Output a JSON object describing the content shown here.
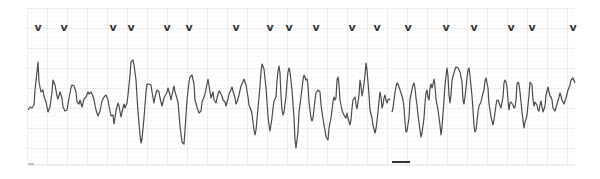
{
  "chart_data": {
    "type": "line",
    "title": "",
    "subtitle": "",
    "xlabel": "",
    "ylabel": "",
    "grid": true,
    "legend": null,
    "paper": {
      "x0": 27,
      "x1": 575,
      "y0": 8,
      "y1": 165,
      "break_x": 390
    },
    "colors": {
      "trace": "#4a4a4a",
      "grid_minor": "#e4e4e4",
      "grid_major": "#cfcfcf",
      "marker": "#333333",
      "background": "#ffffff"
    },
    "markers": {
      "symbol": "v",
      "y": 27,
      "x": [
        38,
        64,
        113,
        131,
        167,
        189,
        236,
        270,
        289,
        316,
        352,
        377,
        408,
        446,
        474,
        511,
        532,
        573
      ]
    },
    "trace_points": [
      [
        28,
        110
      ],
      [
        30,
        107
      ],
      [
        32,
        108
      ],
      [
        34,
        105
      ],
      [
        35,
        90
      ],
      [
        37,
        72
      ],
      [
        38,
        62
      ],
      [
        39,
        82
      ],
      [
        41,
        92
      ],
      [
        43,
        90
      ],
      [
        44,
        96
      ],
      [
        46,
        102
      ],
      [
        48,
        112
      ],
      [
        50,
        107
      ],
      [
        52,
        92
      ],
      [
        53,
        80
      ],
      [
        55,
        85
      ],
      [
        57,
        96
      ],
      [
        58,
        99
      ],
      [
        60,
        92
      ],
      [
        62,
        98
      ],
      [
        63,
        107
      ],
      [
        65,
        111
      ],
      [
        67,
        110
      ],
      [
        69,
        98
      ],
      [
        71,
        88
      ],
      [
        72,
        85
      ],
      [
        74,
        86
      ],
      [
        76,
        92
      ],
      [
        77,
        102
      ],
      [
        79,
        104
      ],
      [
        80,
        100
      ],
      [
        82,
        107
      ],
      [
        84,
        99
      ],
      [
        86,
        97
      ],
      [
        88,
        92
      ],
      [
        89,
        94
      ],
      [
        91,
        92
      ],
      [
        93,
        96
      ],
      [
        94,
        100
      ],
      [
        96,
        110
      ],
      [
        98,
        116
      ],
      [
        100,
        111
      ],
      [
        102,
        101
      ],
      [
        104,
        97
      ],
      [
        106,
        95
      ],
      [
        108,
        100
      ],
      [
        109,
        106
      ],
      [
        111,
        116
      ],
      [
        113,
        115
      ],
      [
        114,
        124
      ],
      [
        116,
        111
      ],
      [
        118,
        103
      ],
      [
        119,
        106
      ],
      [
        121,
        117
      ],
      [
        122,
        112
      ],
      [
        124,
        104
      ],
      [
        125,
        108
      ],
      [
        127,
        103
      ],
      [
        128,
        95
      ],
      [
        130,
        75
      ],
      [
        131,
        62
      ],
      [
        133,
        60
      ],
      [
        134,
        65
      ],
      [
        136,
        80
      ],
      [
        138,
        112
      ],
      [
        140,
        135
      ],
      [
        141,
        143
      ],
      [
        142,
        139
      ],
      [
        144,
        118
      ],
      [
        146,
        92
      ],
      [
        147,
        84
      ],
      [
        149,
        84
      ],
      [
        151,
        85
      ],
      [
        152,
        92
      ],
      [
        154,
        103
      ],
      [
        155,
        97
      ],
      [
        157,
        90
      ],
      [
        159,
        92
      ],
      [
        160,
        98
      ],
      [
        162,
        106
      ],
      [
        164,
        98
      ],
      [
        165,
        96
      ],
      [
        167,
        92
      ],
      [
        168,
        88
      ],
      [
        170,
        95
      ],
      [
        171,
        100
      ],
      [
        173,
        90
      ],
      [
        174,
        86
      ],
      [
        175,
        92
      ],
      [
        176,
        95
      ],
      [
        178,
        102
      ],
      [
        180,
        126
      ],
      [
        182,
        142
      ],
      [
        184,
        144
      ],
      [
        185,
        130
      ],
      [
        187,
        100
      ],
      [
        189,
        82
      ],
      [
        190,
        77
      ],
      [
        192,
        75
      ],
      [
        194,
        84
      ],
      [
        195,
        100
      ],
      [
        197,
        107
      ],
      [
        199,
        113
      ],
      [
        201,
        111
      ],
      [
        202,
        102
      ],
      [
        204,
        97
      ],
      [
        205,
        94
      ],
      [
        207,
        84
      ],
      [
        208,
        79
      ],
      [
        210,
        92
      ],
      [
        211,
        98
      ],
      [
        213,
        92
      ],
      [
        214,
        100
      ],
      [
        216,
        103
      ],
      [
        217,
        98
      ],
      [
        219,
        91
      ],
      [
        220,
        92
      ],
      [
        222,
        96
      ],
      [
        223,
        100
      ],
      [
        225,
        102
      ],
      [
        226,
        106
      ],
      [
        228,
        99
      ],
      [
        229,
        94
      ],
      [
        231,
        90
      ],
      [
        232,
        87
      ],
      [
        233,
        91
      ],
      [
        235,
        98
      ],
      [
        236,
        104
      ],
      [
        237,
        102
      ],
      [
        239,
        95
      ],
      [
        241,
        86
      ],
      [
        243,
        82
      ],
      [
        244,
        79
      ],
      [
        246,
        85
      ],
      [
        248,
        97
      ],
      [
        249,
        105
      ],
      [
        251,
        110
      ],
      [
        252,
        114
      ],
      [
        254,
        130
      ],
      [
        255,
        135
      ],
      [
        256,
        130
      ],
      [
        258,
        108
      ],
      [
        260,
        86
      ],
      [
        261,
        72
      ],
      [
        262,
        64
      ],
      [
        264,
        69
      ],
      [
        266,
        88
      ],
      [
        268,
        116
      ],
      [
        269,
        125
      ],
      [
        270,
        131
      ],
      [
        272,
        118
      ],
      [
        273,
        108
      ],
      [
        274,
        101
      ],
      [
        276,
        97
      ],
      [
        277,
        81
      ],
      [
        278,
        71
      ],
      [
        279,
        66
      ],
      [
        280,
        73
      ],
      [
        281,
        96
      ],
      [
        282,
        110
      ],
      [
        283,
        115
      ],
      [
        284,
        112
      ],
      [
        286,
        96
      ],
      [
        287,
        82
      ],
      [
        288,
        72
      ],
      [
        289,
        68
      ],
      [
        290,
        72
      ],
      [
        292,
        90
      ],
      [
        294,
        118
      ],
      [
        295,
        140
      ],
      [
        296,
        148
      ],
      [
        298,
        132
      ],
      [
        299,
        112
      ],
      [
        301,
        97
      ],
      [
        303,
        80
      ],
      [
        304,
        75
      ],
      [
        306,
        80
      ],
      [
        307,
        79
      ],
      [
        308,
        85
      ],
      [
        309,
        102
      ],
      [
        311,
        118
      ],
      [
        312,
        121
      ],
      [
        313,
        118
      ],
      [
        315,
        100
      ],
      [
        316,
        93
      ],
      [
        318,
        90
      ],
      [
        320,
        92
      ],
      [
        321,
        105
      ],
      [
        322,
        112
      ],
      [
        324,
        125
      ],
      [
        325,
        130
      ],
      [
        326,
        137
      ],
      [
        328,
        140
      ],
      [
        329,
        128
      ],
      [
        331,
        118
      ],
      [
        332,
        110
      ],
      [
        333,
        102
      ],
      [
        334,
        97
      ],
      [
        335,
        100
      ],
      [
        336,
        98
      ],
      [
        337,
        80
      ],
      [
        338,
        77
      ],
      [
        339,
        85
      ],
      [
        340,
        100
      ],
      [
        341,
        105
      ],
      [
        342,
        110
      ],
      [
        343,
        113
      ],
      [
        345,
        117
      ],
      [
        346,
        118
      ],
      [
        347,
        113
      ],
      [
        348,
        118
      ],
      [
        350,
        125
      ],
      [
        351,
        120
      ],
      [
        352,
        108
      ],
      [
        353,
        100
      ],
      [
        355,
        97
      ],
      [
        356,
        104
      ],
      [
        357,
        109
      ],
      [
        359,
        95
      ],
      [
        360,
        80
      ],
      [
        361,
        86
      ],
      [
        362,
        96
      ],
      [
        363,
        91
      ],
      [
        364,
        84
      ],
      [
        365,
        75
      ],
      [
        366,
        63
      ],
      [
        367,
        70
      ],
      [
        369,
        95
      ],
      [
        370,
        110
      ],
      [
        372,
        118
      ],
      [
        373,
        125
      ],
      [
        375,
        133
      ],
      [
        376,
        129
      ],
      [
        378,
        112
      ],
      [
        379,
        101
      ],
      [
        380,
        92
      ],
      [
        381,
        97
      ],
      [
        382,
        108
      ],
      [
        383,
        105
      ],
      [
        384,
        98
      ],
      [
        385,
        95
      ],
      [
        386,
        100
      ],
      [
        387,
        103
      ],
      [
        388,
        100
      ],
      [
        389,
        99
      ],
      [
        390,
        100
      ],
      "BREAK",
      [
        392,
        112
      ],
      [
        393,
        108
      ],
      [
        395,
        92
      ],
      [
        396,
        87
      ],
      [
        397,
        83
      ],
      [
        398,
        84
      ],
      [
        399,
        87
      ],
      [
        400,
        90
      ],
      [
        402,
        96
      ],
      [
        403,
        100
      ],
      [
        404,
        107
      ],
      [
        405,
        122
      ],
      [
        406,
        132
      ],
      [
        407,
        131
      ],
      [
        409,
        118
      ],
      [
        410,
        99
      ],
      [
        412,
        90
      ],
      [
        413,
        85
      ],
      [
        414,
        83
      ],
      [
        415,
        88
      ],
      [
        416,
        98
      ],
      [
        417,
        105
      ],
      [
        418,
        115
      ],
      [
        420,
        130
      ],
      [
        421,
        137
      ],
      [
        422,
        133
      ],
      [
        424,
        118
      ],
      [
        425,
        103
      ],
      [
        426,
        93
      ],
      [
        427,
        90
      ],
      [
        428,
        97
      ],
      [
        429,
        100
      ],
      [
        430,
        88
      ],
      [
        431,
        84
      ],
      [
        432,
        88
      ],
      [
        433,
        84
      ],
      [
        434,
        79
      ],
      [
        435,
        86
      ],
      [
        436,
        99
      ],
      [
        438,
        110
      ],
      [
        440,
        125
      ],
      [
        441,
        135
      ],
      [
        442,
        127
      ],
      [
        444,
        100
      ],
      [
        445,
        85
      ],
      [
        446,
        76
      ],
      [
        447,
        68
      ],
      [
        448,
        76
      ],
      [
        449,
        95
      ],
      [
        450,
        103
      ],
      [
        451,
        95
      ],
      [
        452,
        80
      ],
      [
        454,
        73
      ],
      [
        455,
        69
      ],
      [
        456,
        67
      ],
      [
        458,
        68
      ],
      [
        460,
        72
      ],
      [
        462,
        82
      ],
      [
        463,
        100
      ],
      [
        464,
        104
      ],
      [
        465,
        97
      ],
      [
        467,
        78
      ],
      [
        468,
        70
      ],
      [
        469,
        68
      ],
      [
        470,
        76
      ],
      [
        472,
        96
      ],
      [
        473,
        110
      ],
      [
        474,
        126
      ],
      [
        475,
        132
      ],
      [
        476,
        130
      ],
      [
        478,
        112
      ],
      [
        479,
        106
      ],
      [
        481,
        102
      ],
      [
        482,
        97
      ],
      [
        484,
        90
      ],
      [
        485,
        81
      ],
      [
        486,
        78
      ],
      [
        488,
        88
      ],
      [
        489,
        104
      ],
      [
        490,
        110
      ],
      [
        491,
        117
      ],
      [
        493,
        125
      ],
      [
        494,
        120
      ],
      [
        496,
        105
      ],
      [
        497,
        100
      ],
      [
        498,
        100
      ],
      [
        499,
        103
      ],
      [
        501,
        108
      ],
      [
        503,
        97
      ],
      [
        504,
        83
      ],
      [
        505,
        80
      ],
      [
        506,
        82
      ],
      [
        507,
        87
      ],
      [
        508,
        100
      ],
      [
        509,
        110
      ],
      [
        510,
        103
      ],
      [
        511,
        102
      ],
      [
        513,
        105
      ],
      [
        514,
        108
      ],
      [
        515,
        107
      ],
      [
        516,
        100
      ],
      [
        517,
        84
      ],
      [
        518,
        82
      ],
      [
        519,
        84
      ],
      [
        520,
        92
      ],
      [
        522,
        112
      ],
      [
        524,
        128
      ],
      [
        525,
        122
      ],
      [
        526,
        119
      ],
      [
        527,
        115
      ],
      [
        528,
        105
      ],
      [
        529,
        95
      ],
      [
        530,
        82
      ],
      [
        532,
        85
      ],
      [
        533,
        100
      ],
      [
        534,
        106
      ],
      [
        535,
        102
      ],
      [
        537,
        105
      ],
      [
        538,
        110
      ],
      [
        539,
        111
      ],
      [
        540,
        105
      ],
      [
        541,
        101
      ],
      [
        542,
        107
      ],
      [
        543,
        112
      ],
      [
        545,
        106
      ],
      [
        546,
        95
      ],
      [
        548,
        87
      ],
      [
        549,
        92
      ],
      [
        550,
        96
      ],
      [
        551,
        97
      ],
      [
        552,
        100
      ],
      [
        553,
        108
      ],
      [
        555,
        111
      ],
      [
        557,
        104
      ],
      [
        559,
        97
      ],
      [
        560,
        93
      ],
      [
        561,
        96
      ],
      [
        562,
        100
      ],
      [
        564,
        104
      ],
      [
        566,
        98
      ],
      [
        568,
        90
      ],
      [
        570,
        85
      ],
      [
        571,
        80
      ],
      [
        573,
        78
      ],
      [
        575,
        83
      ]
    ],
    "ylim": [
      8,
      165
    ],
    "xlim": [
      27,
      575
    ]
  }
}
